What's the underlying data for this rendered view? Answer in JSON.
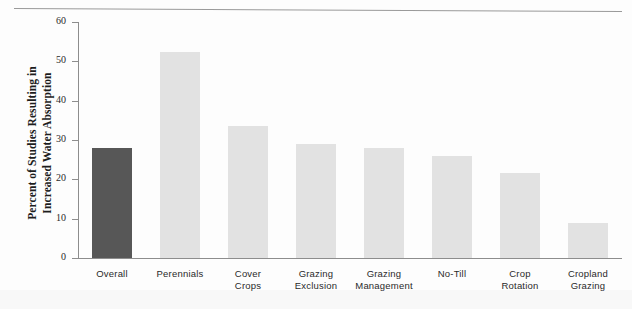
{
  "chart_data": {
    "type": "bar",
    "title": "",
    "xlabel": "",
    "ylabel": "Percent of Studies Resulting in\nIncreased Water Absorption",
    "ylim": [
      0,
      60
    ],
    "ytick_values": [
      0,
      10,
      20,
      30,
      40,
      50,
      60
    ],
    "ytick_labels": [
      "0",
      "10",
      "20",
      "30",
      "40",
      "50",
      "60"
    ],
    "grid": false,
    "legend": "none",
    "categories": [
      "Overall",
      "Perennials",
      "Cover\nCrops",
      "Grazing\nExclusion",
      "Grazing\nManagement",
      "No-Till",
      "Crop\nRotation",
      "Cropland\nGrazing"
    ],
    "values": [
      28,
      52.5,
      33.5,
      29,
      28,
      26,
      21.5,
      9
    ],
    "bar_colors": [
      "#575757",
      "#e2e2e2",
      "#e2e2e2",
      "#e2e2e2",
      "#e2e2e2",
      "#e2e2e2",
      "#e2e2e2",
      "#e2e2e2"
    ],
    "highlight_index": 0,
    "accent_dark": "#575757",
    "accent_light": "#e2e2e2",
    "axis_color": "#8d8d8d"
  }
}
